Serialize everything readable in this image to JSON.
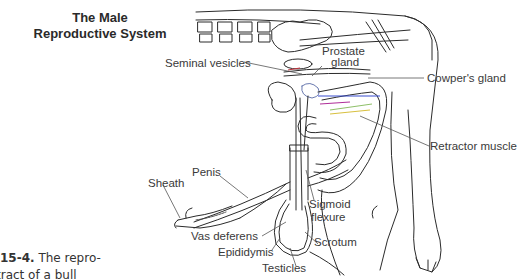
{
  "title": {
    "line1": "The Male",
    "line2": "Reproductive System"
  },
  "labels": {
    "seminal_vesicles": "Seminal vesicles",
    "prostate_gland_line1": "Prostate",
    "prostate_gland_line2": "gland",
    "cowpers_gland": "Cowper's gland",
    "retractor_muscle": "Retractor muscle",
    "penis": "Penis",
    "sheath": "Sheath",
    "sigmoid_flexure_line1": "Sigmoid",
    "sigmoid_flexure_line2": "flexure",
    "vas_deferens": "Vas deferens",
    "scrotum": "Scrotum",
    "epididymis": "Epididymis",
    "testicles": "Testicles"
  },
  "caption": {
    "figure_number": "15-4.",
    "text_line1": "The repro-",
    "text_line2": "tract of a bull"
  },
  "colors": {
    "line": "#2b2b2b",
    "leader": "#555555",
    "accent_blue": "#3a4fd0",
    "accent_green": "#8fc06a",
    "accent_magenta": "#b0309a",
    "accent_red": "#c0303a",
    "accent_yellow": "#d8c040"
  }
}
